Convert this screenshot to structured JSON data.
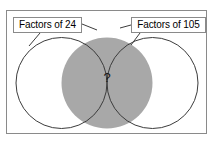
{
  "diagram": {
    "type": "venn-diagram",
    "title_left_label": "Factors of 24",
    "title_right_label": "Factors of 105",
    "intersection_text": "?",
    "colors": {
      "frame_border": "#8a8a8a",
      "circle_stroke": "#3c3c3c",
      "intersection_fill": "#a8a8a8",
      "background": "#ffffff",
      "text": "#000000"
    },
    "sets": [
      {
        "name": "Factors of 24",
        "side": "left"
      },
      {
        "name": "Factors of 105",
        "side": "right"
      }
    ],
    "regions": {
      "left_only": "",
      "right_only": "",
      "intersection": "?"
    }
  }
}
